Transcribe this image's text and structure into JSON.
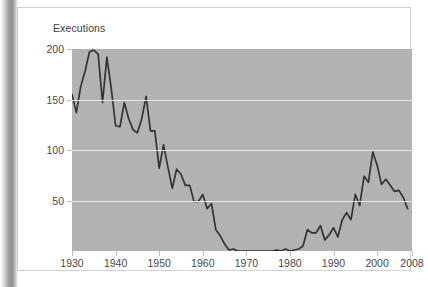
{
  "figure": {
    "y_axis_title": "Executions"
  },
  "chart_data": {
    "type": "line",
    "title": "",
    "subtitle": "",
    "xlabel": "",
    "ylabel": "Executions",
    "xlim": [
      1930,
      2008
    ],
    "ylim": [
      0,
      200
    ],
    "grid": true,
    "grid_values": [
      50,
      100,
      150
    ],
    "legend": "none",
    "line_color": "#333333",
    "plot_background": "#b2b2b2",
    "gridline_color": "#e8e8e8",
    "axis_text_color": "#4a4a4a",
    "y_ticks": [
      50,
      100,
      150,
      200
    ],
    "y_tick_labels": [
      "50",
      "100",
      "150",
      "200"
    ],
    "x_ticks": [
      1930,
      1940,
      1950,
      1960,
      1970,
      1980,
      1990,
      2000,
      2008
    ],
    "x_tick_labels": [
      "1930",
      "1940",
      "1950",
      "1960",
      "1970",
      "1980",
      "1990",
      "2000",
      "2008"
    ],
    "x": [
      1930,
      1931,
      1932,
      1933,
      1934,
      1935,
      1936,
      1937,
      1938,
      1939,
      1940,
      1941,
      1942,
      1943,
      1944,
      1945,
      1946,
      1947,
      1948,
      1949,
      1950,
      1951,
      1952,
      1953,
      1954,
      1955,
      1956,
      1957,
      1958,
      1959,
      1960,
      1961,
      1962,
      1963,
      1964,
      1965,
      1966,
      1967,
      1968,
      1969,
      1970,
      1971,
      1972,
      1973,
      1974,
      1975,
      1976,
      1977,
      1978,
      1979,
      1980,
      1981,
      1982,
      1983,
      1984,
      1985,
      1986,
      1987,
      1988,
      1989,
      1990,
      1991,
      1992,
      1993,
      1994,
      1995,
      1996,
      1997,
      1998,
      1999,
      2000,
      2001,
      2002,
      2003,
      2004,
      2005,
      2006,
      2007
    ],
    "y": [
      155,
      137,
      163,
      178,
      197,
      199,
      195,
      147,
      192,
      161,
      124,
      123,
      147,
      131,
      120,
      117,
      131,
      153,
      119,
      119,
      82,
      105,
      83,
      62,
      81,
      76,
      65,
      65,
      49,
      49,
      56,
      42,
      47,
      21,
      15,
      7,
      1,
      2,
      0,
      0,
      0,
      0,
      0,
      0,
      0,
      0,
      0,
      1,
      0,
      2,
      0,
      1,
      2,
      5,
      21,
      18,
      18,
      25,
      11,
      16,
      23,
      14,
      31,
      38,
      31,
      56,
      45,
      74,
      68,
      98,
      85,
      66,
      71,
      65,
      59,
      60,
      53,
      42
    ],
    "series": [
      {
        "name": "Executions",
        "values": [
          155,
          137,
          163,
          178,
          197,
          199,
          195,
          147,
          192,
          161,
          124,
          123,
          147,
          131,
          120,
          117,
          131,
          153,
          119,
          119,
          82,
          105,
          83,
          62,
          81,
          76,
          65,
          65,
          49,
          49,
          56,
          42,
          47,
          21,
          15,
          7,
          1,
          2,
          0,
          0,
          0,
          0,
          0,
          0,
          0,
          0,
          0,
          1,
          0,
          2,
          0,
          1,
          2,
          5,
          21,
          18,
          18,
          25,
          11,
          16,
          23,
          14,
          31,
          38,
          31,
          56,
          45,
          74,
          68,
          98,
          85,
          66,
          71,
          65,
          59,
          60,
          53,
          42
        ]
      }
    ]
  }
}
